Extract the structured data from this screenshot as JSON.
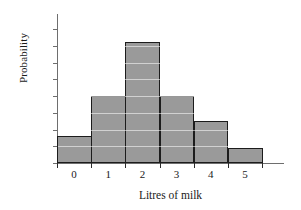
{
  "chart_data": {
    "type": "bar",
    "title": "",
    "subtitle": "",
    "xlabel": "Litres of milk",
    "ylabel": "Probability",
    "categories": [
      "0",
      "1",
      "2",
      "3",
      "4",
      "5"
    ],
    "values": [
      0.08,
      0.2,
      0.36,
      0.2,
      0.125,
      0.045
    ],
    "series": [
      {
        "name": "Probability",
        "values": [
          0.08,
          0.2,
          0.36,
          0.2,
          0.125,
          0.045
        ]
      }
    ],
    "ylim": [
      0.0,
      0.4
    ],
    "xlim": [
      -0.5,
      5.5
    ],
    "ytick_labels": [
      "0.00",
      "0.05",
      "0.10",
      "0.15",
      "0.20",
      "0.25",
      "0.30",
      "0.35",
      "0.40"
    ],
    "ytick_values": [
      0.0,
      0.05,
      0.1,
      0.15,
      0.2,
      0.25,
      0.3,
      0.35,
      0.4
    ],
    "xtick_labels": [
      "0",
      "1",
      "2",
      "3",
      "4",
      "5"
    ],
    "grid": "horizontal-white-over-bars",
    "legend": "none",
    "legend_position": "none",
    "bar_style": "contiguous-histogram",
    "colors": {
      "bar_fill": "#9a9a9a",
      "bar_edge": "#1c1c1c",
      "axis": "#6e6e6e",
      "gridline": "#ffffff",
      "text": "#1a1a1a",
      "background": "#ffffff"
    }
  }
}
